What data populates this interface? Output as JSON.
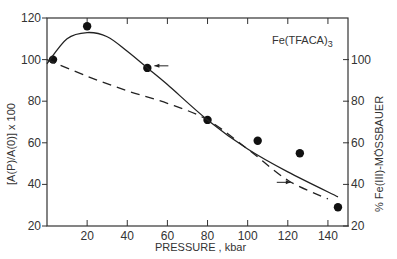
{
  "chart_data": {
    "type": "line",
    "title": "",
    "annotation": "Fe(TFACA)3",
    "xlabel": "PRESSURE , kbar",
    "ylabel": "[A(P)/A(0)] x 100",
    "ylabel_right": "% Fe(III)-MÖSSBAUER",
    "xlim": [
      0,
      150
    ],
    "ylim": [
      20,
      120
    ],
    "ylim_right": [
      20,
      120
    ],
    "x_ticks": [
      20,
      40,
      60,
      80,
      100,
      120,
      140
    ],
    "y_ticks": [
      20,
      40,
      60,
      80,
      100,
      120
    ],
    "y_ticks_right": [
      20,
      40,
      60,
      80,
      100
    ],
    "grid": false,
    "legend": "none",
    "series": [
      {
        "name": "[A(P)/A(0)] x 100 (points)",
        "style": "markers",
        "axis": "left",
        "x": [
          3,
          20,
          50,
          80,
          105,
          126,
          145
        ],
        "values": [
          100,
          116,
          96,
          71,
          61,
          55,
          29
        ]
      },
      {
        "name": "[A(P)/A(0)] x 100 (smooth fit)",
        "style": "solid",
        "axis": "left",
        "x": [
          0,
          10,
          20,
          30,
          40,
          50,
          60,
          80,
          100,
          120,
          145
        ],
        "values": [
          98,
          110,
          113,
          111,
          104,
          96,
          88,
          71,
          57,
          46,
          34
        ]
      },
      {
        "name": "% Fe(III) Mössbauer",
        "style": "dashed",
        "axis": "right",
        "x": [
          0,
          20,
          40,
          60,
          80,
          100,
          120,
          140
        ],
        "values": [
          100,
          92,
          85,
          79,
          71,
          57,
          42,
          33
        ]
      }
    ],
    "arrows": [
      {
        "near_series": "solid",
        "points_to": "left",
        "at": [
          57,
          97
        ]
      },
      {
        "near_series": "dashed",
        "points_to": "right",
        "at": [
          118,
          41
        ]
      }
    ]
  }
}
